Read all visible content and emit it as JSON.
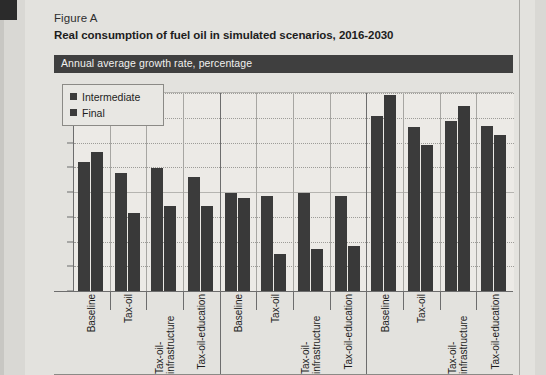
{
  "figure": {
    "label": "Figure A",
    "title": "Real consumption of fuel oil in simulated scenarios, 2016-2030",
    "subtitle_bar": "Annual average growth rate, percentage"
  },
  "legend": {
    "position": "top-left-inside-plot",
    "items": [
      {
        "label": "Intermediate",
        "color": "#3b3b3b"
      },
      {
        "label": "Final",
        "color": "#393939"
      }
    ]
  },
  "axis": {
    "y_ticks": [
      "0.00",
      "1.00",
      "2.00",
      "3.00",
      "4.00",
      "5.00",
      "6.00",
      "7.00",
      "8.00"
    ]
  },
  "chart_data": {
    "type": "bar",
    "title": "Real consumption of fuel oil in simulated scenarios, 2016-2030",
    "subtitle": "Annual average growth rate, percentage",
    "xlabel": "",
    "ylabel": "",
    "ylim": [
      0,
      8
    ],
    "ytick_step": 1,
    "grid": true,
    "legend_position": "top-left",
    "categories": [
      "Baseline",
      "Tax-oil",
      "Tax-oil-infrastructure",
      "Tax-oil-education",
      "Baseline",
      "Tax-oil",
      "Tax-oil-infrastructure",
      "Tax-oil-education",
      "Baseline",
      "Tax-oil",
      "Tax-oil-infrastructure",
      "Tax-oil-education"
    ],
    "groups": [
      {
        "name": "Group 1",
        "categories": [
          "Baseline",
          "Tax-oil",
          "Tax-oil-infrastructure",
          "Tax-oil-education"
        ]
      },
      {
        "name": "Group 2",
        "categories": [
          "Baseline",
          "Tax-oil",
          "Tax-oil-infrastructure",
          "Tax-oil-education"
        ]
      },
      {
        "name": "Group 3",
        "categories": [
          "Baseline",
          "Tax-oil",
          "Tax-oil-infrastructure",
          "Tax-oil-education"
        ]
      }
    ],
    "series": [
      {
        "name": "Intermediate",
        "color": "#3b3b3b",
        "values": [
          5.22,
          4.78,
          4.96,
          4.61,
          3.95,
          3.84,
          3.97,
          3.85,
          7.06,
          6.61,
          6.86,
          6.67
        ]
      },
      {
        "name": "Final",
        "color": "#393939",
        "values": [
          5.62,
          3.14,
          3.44,
          3.43,
          3.77,
          1.48,
          1.68,
          1.82,
          7.94,
          5.88,
          7.46,
          6.29
        ]
      }
    ]
  }
}
